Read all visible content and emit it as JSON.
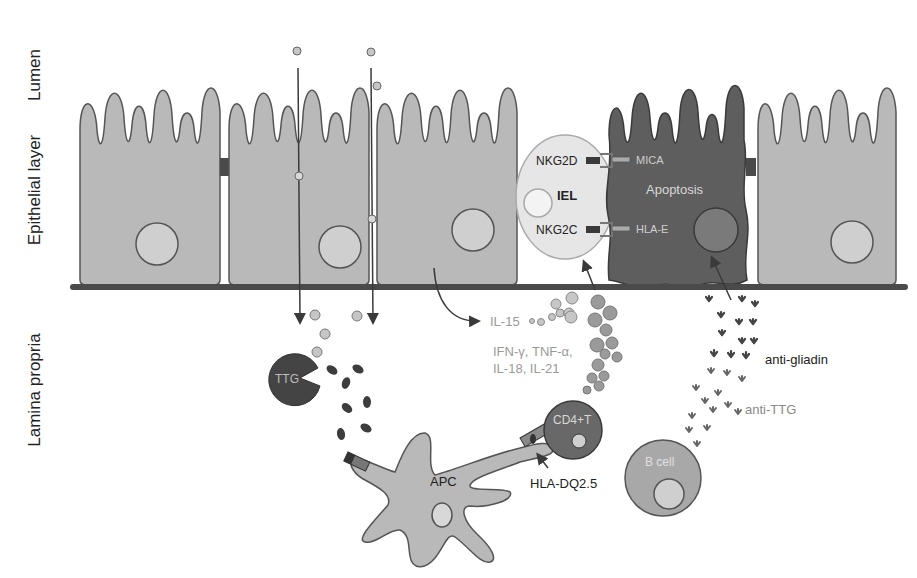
{
  "regions": {
    "lumen": "Lumen",
    "epithelial": "Epithelial layer",
    "lamina": "Lamina propria"
  },
  "cells": {
    "iel": "IEL",
    "nkg2d": "NKG2D",
    "nkg2c": "NKG2C",
    "mica": "MICA",
    "hlae": "HLA-E",
    "apoptosis": "Apoptosis",
    "ttg": "TTG",
    "apc": "APC",
    "cd4": "CD4+T",
    "hladq": "HLA-DQ2.5",
    "bcell": "B cell"
  },
  "cytokines": {
    "il15": "IL-15",
    "line1": "IFN-γ, TNF-α,",
    "line2": "IL-18, IL-21"
  },
  "antibodies": {
    "antigliadin": "anti-gliadin",
    "antittg": "anti-TTG"
  },
  "colors": {
    "cell_fill": "#b9b9b9",
    "cell_stroke": "#555555",
    "apoptotic_fill": "#5e5e5e",
    "nucleus_fill": "#cfcfcf",
    "membrane": "#4a4a4a",
    "dark": "#3a3a3a",
    "light_text": "#9a9a9a"
  }
}
